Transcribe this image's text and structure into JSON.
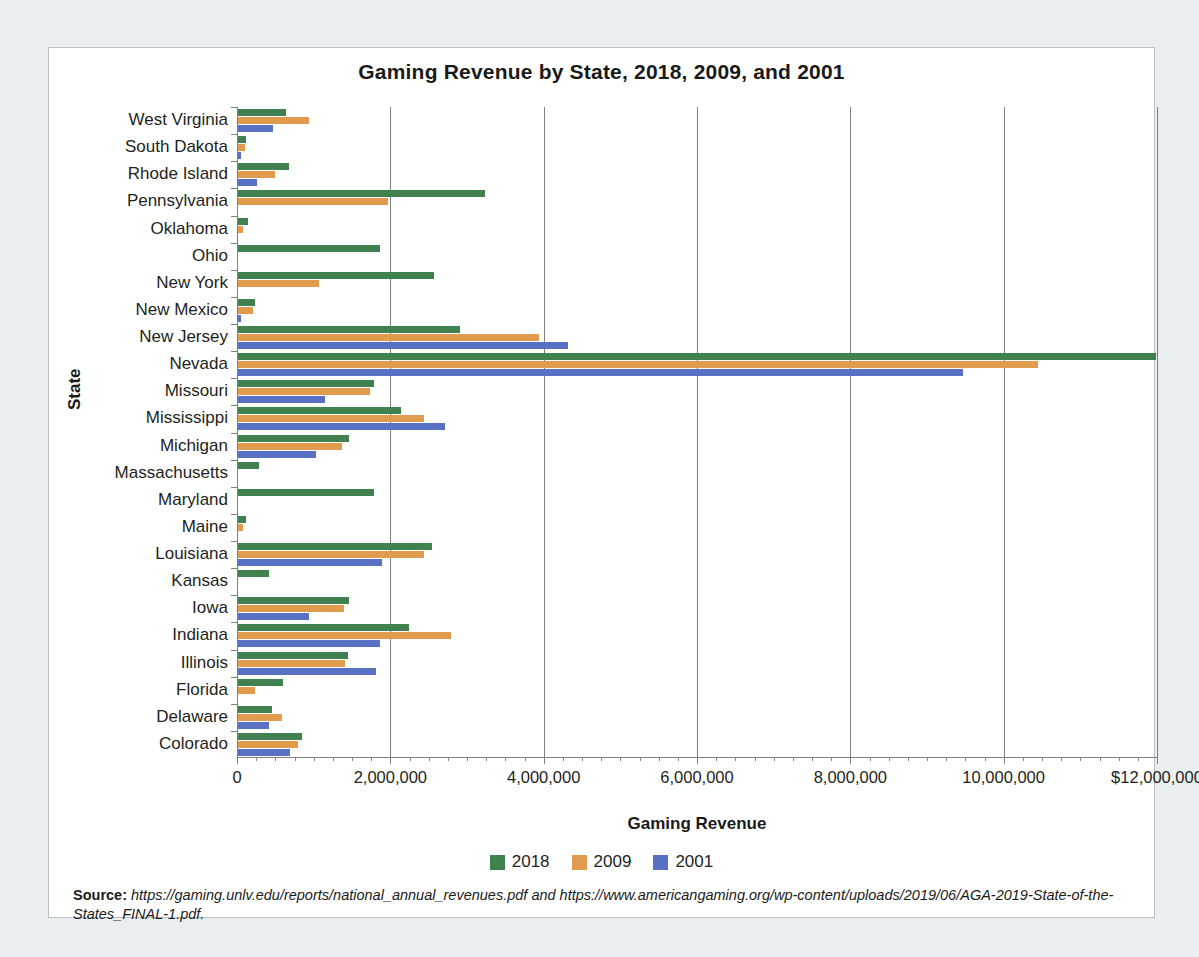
{
  "chart_data": {
    "type": "bar",
    "orientation": "horizontal",
    "title": "Gaming Revenue by State, 2018, 2009, and 2001",
    "xlabel": "Gaming Revenue",
    "ylabel": "State",
    "xlim": [
      0,
      12000000
    ],
    "grid": true,
    "legend_position": "bottom",
    "xticks": [
      0,
      2000000,
      4000000,
      6000000,
      8000000,
      10000000,
      12000000
    ],
    "xtick_labels": [
      "0",
      "2,000,000",
      "4,000,000",
      "6,000,000",
      "8,000,000",
      "10,000,000",
      "$12,000,000"
    ],
    "categories": [
      "West Virginia",
      "South Dakota",
      "Rhode Island",
      "Pennsylvania",
      "Oklahoma",
      "Ohio",
      "New York",
      "New Mexico",
      "New Jersey",
      "Nevada",
      "Missouri",
      "Mississippi",
      "Michigan",
      "Massachusetts",
      "Maryland",
      "Maine",
      "Louisiana",
      "Kansas",
      "Iowa",
      "Indiana",
      "Illinois",
      "Florida",
      "Delaware",
      "Colorado"
    ],
    "series": [
      {
        "name": "2018",
        "color": "#41814f",
        "values": [
          625000,
          110000,
          660000,
          3220000,
          130000,
          1850000,
          2550000,
          220000,
          2900000,
          11970000,
          1780000,
          2120000,
          1450000,
          270000,
          1780000,
          110000,
          2530000,
          400000,
          1450000,
          2230000,
          1430000,
          590000,
          440000,
          840000
        ]
      },
      {
        "name": "2009",
        "color": "#e09b4e",
        "values": [
          930000,
          90000,
          480000,
          1950000,
          70000,
          0,
          1050000,
          190000,
          3920000,
          10430000,
          1720000,
          2420000,
          1350000,
          0,
          0,
          60000,
          2420000,
          0,
          1380000,
          2780000,
          1390000,
          220000,
          570000,
          780000
        ]
      },
      {
        "name": "2001",
        "color": "#5871c4",
        "values": [
          460000,
          40000,
          250000,
          0,
          0,
          0,
          0,
          40000,
          4300000,
          9450000,
          1130000,
          2700000,
          1020000,
          0,
          0,
          0,
          1880000,
          0,
          930000,
          1850000,
          1800000,
          0,
          410000,
          680000
        ]
      }
    ]
  },
  "legend": {
    "items": [
      {
        "label": "2018",
        "color": "#41814f"
      },
      {
        "label": "2009",
        "color": "#e09b4e"
      },
      {
        "label": "2001",
        "color": "#5871c4"
      }
    ]
  },
  "source": {
    "label": "Source:",
    "text": " https://gaming.unlv.edu/reports/national_annual_revenues.pdf and https://www.americangaming.org/wp-content/uploads/2019/06/AGA-2019-State-of-the-States_FINAL-1.pdf."
  }
}
